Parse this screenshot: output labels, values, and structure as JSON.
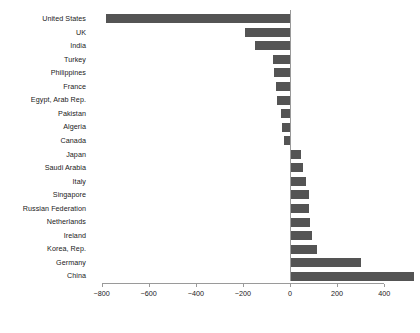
{
  "chart_data": {
    "type": "bar",
    "orientation": "horizontal",
    "title": "",
    "subtitle": "",
    "xlabel": "",
    "ylabel": "",
    "grid": false,
    "legend": false,
    "legend_position": "none",
    "bar_color": "#545454",
    "axis_color": "#9a9a9a",
    "text_color": "#1a1a1a",
    "background": "#ffffff",
    "xlim": [
      -880,
      560
    ],
    "xticks": [
      -800,
      -600,
      -400,
      -200,
      0,
      200,
      400
    ],
    "xtick_labels": [
      "−800",
      "−600",
      "−400",
      "−200",
      "0",
      "200",
      "400"
    ],
    "categories": [
      "United States",
      "UK",
      "India",
      "Turkey",
      "Philippines",
      "France",
      "Egypt, Arab Rep.",
      "Pakistan",
      "Algeria",
      "Canada",
      "Japan",
      "Saudi Arabia",
      "Italy",
      "Singapore",
      "Russian Federation",
      "Netherlands",
      "Ireland",
      "Korea, Rep.",
      "Germany",
      "China"
    ],
    "values": [
      -780,
      -190,
      -148,
      -72,
      -68,
      -60,
      -55,
      -40,
      -34,
      -25,
      48,
      55,
      68,
      80,
      82,
      86,
      95,
      115,
      300,
      525
    ]
  }
}
